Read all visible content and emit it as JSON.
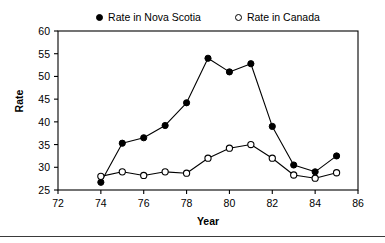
{
  "chart_data": {
    "type": "line",
    "title": "",
    "xlabel": "Year",
    "ylabel": "Rate",
    "xlim": [
      72,
      86
    ],
    "ylim": [
      25,
      60
    ],
    "xticks": [
      72,
      74,
      76,
      78,
      80,
      82,
      84,
      86
    ],
    "yticks": [
      25,
      30,
      35,
      40,
      45,
      50,
      55,
      60
    ],
    "grid": false,
    "legend_position": "top-center",
    "x": [
      74,
      75,
      76,
      77,
      78,
      79,
      80,
      81,
      82,
      83,
      84,
      85
    ],
    "series": [
      {
        "name": "Rate in Nova Scotia",
        "marker": "filled-circle",
        "color": "#000000",
        "values": [
          26.7,
          35.3,
          36.5,
          39.2,
          44.2,
          54.0,
          51.0,
          52.8,
          39.0,
          30.5,
          29.0,
          32.5
        ]
      },
      {
        "name": "Rate in Canada",
        "marker": "open-circle",
        "color": "#000000",
        "values": [
          28.0,
          29.0,
          28.2,
          29.0,
          28.7,
          32.0,
          34.2,
          35.0,
          32.0,
          28.3,
          27.6,
          28.8
        ]
      }
    ]
  },
  "legend": {
    "entries": [
      {
        "label": "Rate in Nova Scotia",
        "marker": "filled-circle-icon"
      },
      {
        "label": "Rate in Canada",
        "marker": "open-circle-icon"
      }
    ]
  },
  "axes": {
    "y_title": "Rate",
    "x_title": "Year",
    "y_tick_labels": [
      "60",
      "55",
      "50",
      "45",
      "40",
      "35",
      "30",
      "25"
    ],
    "x_tick_labels": [
      "72",
      "74",
      "76",
      "78",
      "80",
      "82",
      "84",
      "86"
    ]
  }
}
